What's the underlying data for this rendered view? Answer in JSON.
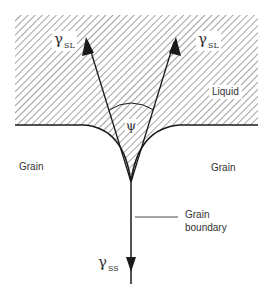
{
  "figure": {
    "labels": {
      "gamma_sl_left": {
        "symbol": "γ",
        "subscript": "SL"
      },
      "gamma_sl_right": {
        "symbol": "γ",
        "subscript": "SL"
      },
      "gamma_ss": {
        "symbol": "γ",
        "subscript": "SS"
      },
      "psi": "ψ",
      "liquid": "Liquid",
      "grain_left": "Grain",
      "grain_right": "Grain",
      "grain_boundary_line1": "Grain",
      "grain_boundary_line2": "boundary"
    },
    "colors": {
      "line": "#1a1a1a",
      "hatch": "#555555",
      "text": "#333333",
      "background": "#ffffff"
    }
  }
}
